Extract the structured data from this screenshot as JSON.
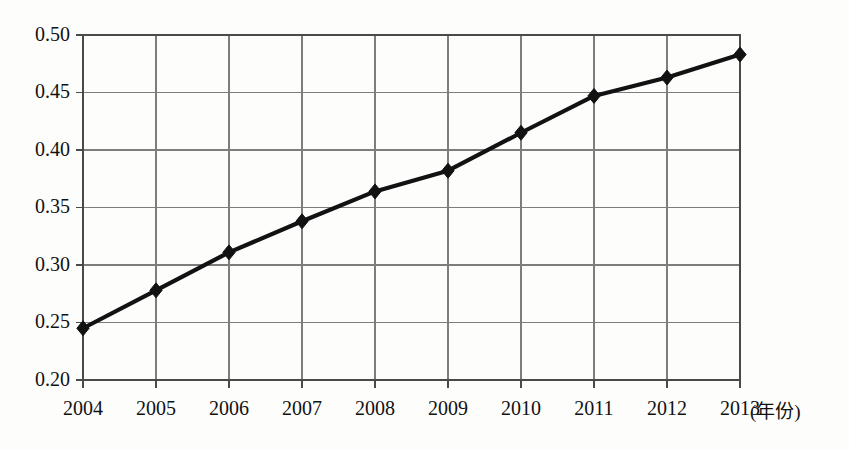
{
  "chart_data": {
    "type": "line",
    "title": "",
    "subtitle": "",
    "xlabel": "(年份)",
    "ylabel": "",
    "categories": [
      "2004",
      "2005",
      "2006",
      "2007",
      "2008",
      "2009",
      "2010",
      "2011",
      "2012",
      "2013"
    ],
    "x": [
      2004,
      2005,
      2006,
      2007,
      2008,
      2009,
      2010,
      2011,
      2012,
      2013
    ],
    "values": [
      0.245,
      0.278,
      0.311,
      0.338,
      0.364,
      0.382,
      0.415,
      0.447,
      0.463,
      0.483
    ],
    "series": [
      {
        "name": "",
        "values": [
          0.245,
          0.278,
          0.311,
          0.338,
          0.364,
          0.382,
          0.415,
          0.447,
          0.463,
          0.483
        ]
      }
    ],
    "ylim": [
      0.2,
      0.5
    ],
    "xlim": [
      2004,
      2013
    ],
    "ytick_labels": [
      "0.50",
      "0.45",
      "0.40",
      "0.35",
      "0.30",
      "0.25",
      "0.20"
    ],
    "ytick_values": [
      0.5,
      0.45,
      0.4,
      0.35,
      0.3,
      0.25,
      0.2
    ],
    "xtick_labels": [
      "2004",
      "2005",
      "2006",
      "2007",
      "2008",
      "2009",
      "2010",
      "2011",
      "2012",
      "2013"
    ],
    "grid": true,
    "legend": "none",
    "marker": "diamond",
    "line_color": "#121212",
    "grid_color": "#7d7d7d",
    "frame_color": "#4a4a4a",
    "background_color": "#fdfdfc",
    "annotations": [
      "(年份)"
    ]
  },
  "axis": {
    "x_unit_note": "(年份)"
  }
}
